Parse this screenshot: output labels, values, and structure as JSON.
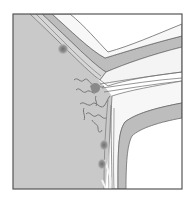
{
  "diagram": {
    "type": "anatomical-illustration",
    "style": "grayscale",
    "labels": [],
    "colors": {
      "background": "#ffffff",
      "frame": "#555555",
      "tissue": "#c9c9c9",
      "band": "#bdbdbd",
      "band_outline": "#6a6a6a",
      "lumen": "#f4f4f4",
      "vessel": "#777777",
      "nodule": "#8a8a8a"
    },
    "elements": [
      {
        "name": "tissue-mass",
        "description": "large gray tissue region on the left"
      },
      {
        "name": "upper-layered-wall",
        "description": "curved multi-layer band from top-left bending to the right"
      },
      {
        "name": "lower-layered-wall",
        "description": "curved multi-layer band bending down to the bottom"
      },
      {
        "name": "branching-vessels",
        "description": "tortuous vessels in the junction area"
      },
      {
        "name": "nodules",
        "count": 4
      }
    ]
  }
}
